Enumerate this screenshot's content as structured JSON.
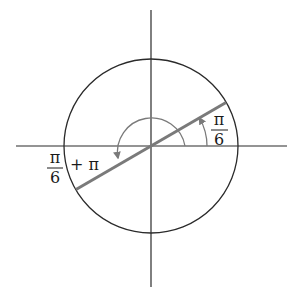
{
  "diagram": {
    "type": "unit-circle",
    "center": [
      151,
      146
    ],
    "radius": 87,
    "axes": {
      "horizontal": {
        "x1": 16,
        "x2": 287,
        "y": 146
      },
      "vertical": {
        "x": 151,
        "y1": 10,
        "y2": 287
      }
    },
    "line_angle_deg": 30,
    "colors": {
      "axis": "#2a2a2a",
      "circle": "#2a2a2a",
      "line": "#7a7a7a",
      "arc": "#7a7a7a"
    },
    "labels": {
      "small_angle": {
        "numerator": "π",
        "denominator": "6"
      },
      "large_angle": {
        "numerator": "π",
        "denominator": "6",
        "suffix": "+ π"
      }
    }
  }
}
